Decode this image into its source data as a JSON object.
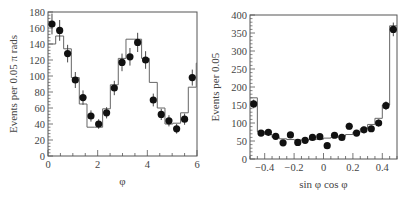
{
  "chart_data": [
    {
      "type": "scatter",
      "title": "",
      "xlabel": "φ",
      "ylabel": "Events per 0.05 π rads",
      "xlim": [
        0,
        6
      ],
      "ylim": [
        0,
        180
      ],
      "xticks": [
        0,
        2,
        4,
        6
      ],
      "yticks": [
        0,
        20,
        40,
        60,
        80,
        100,
        120,
        140,
        160,
        180
      ],
      "grid": false,
      "legend": null,
      "series": [
        {
          "name": "data",
          "style": "points-with-errorbars",
          "x": [
            0.16,
            0.47,
            0.79,
            1.1,
            1.41,
            1.73,
            2.04,
            2.36,
            2.67,
            2.98,
            3.3,
            3.61,
            3.93,
            4.24,
            4.56,
            4.87,
            5.18,
            5.5,
            5.81,
            6.12
          ],
          "x_plotted": [
            0.16,
            0.47,
            0.79,
            1.1,
            1.41,
            1.73,
            2.04,
            2.36,
            2.67,
            2.98,
            3.3,
            3.61,
            3.93,
            4.24,
            4.56,
            4.87,
            5.18,
            5.5,
            5.81
          ],
          "values": [
            165,
            157,
            128,
            95,
            73,
            50,
            40,
            54,
            85,
            117,
            124,
            142,
            120,
            70,
            52,
            44,
            34,
            46,
            98,
            125
          ],
          "errors": [
            13,
            13,
            11,
            10,
            9,
            7,
            6,
            7,
            9,
            11,
            11,
            12,
            11,
            8,
            7,
            7,
            6,
            7,
            10,
            11
          ]
        },
        {
          "name": "fit",
          "style": "step-histogram",
          "bin_edges": [
            0,
            0.31,
            0.63,
            0.94,
            1.26,
            1.57,
            1.88,
            2.2,
            2.51,
            2.83,
            3.14,
            3.46,
            3.77,
            4.08,
            4.4,
            4.71,
            5.03,
            5.34,
            5.65,
            5.97
          ],
          "values": [
            140,
            150,
            134,
            98,
            65,
            36,
            36,
            59,
            89,
            122,
            146,
            146,
            122,
            92,
            60,
            40,
            41,
            54,
            86,
            116
          ]
        }
      ]
    },
    {
      "type": "scatter",
      "title": "",
      "xlabel": "sin φ cos φ",
      "ylabel": "Events per 0.05",
      "xlim": [
        -0.5,
        0.5
      ],
      "ylim": [
        0,
        400
      ],
      "xticks": [
        -0.4,
        -0.2,
        0,
        0.2,
        0.4
      ],
      "yticks": [
        0,
        50,
        100,
        150,
        200,
        250,
        300,
        350,
        400
      ],
      "grid": false,
      "legend": null,
      "series": [
        {
          "name": "data",
          "style": "points-with-errorbars",
          "x": [
            -0.475,
            -0.425,
            -0.375,
            -0.325,
            -0.275,
            -0.225,
            -0.175,
            -0.125,
            -0.075,
            -0.025,
            0.025,
            0.075,
            0.125,
            0.175,
            0.225,
            0.275,
            0.325,
            0.375,
            0.425,
            0.475
          ],
          "values": [
            153,
            72,
            74,
            63,
            45,
            67,
            46,
            52,
            60,
            62,
            37,
            66,
            60,
            91,
            72,
            81,
            84,
            100,
            148,
            360
          ],
          "errors": [
            12,
            8,
            9,
            8,
            7,
            8,
            7,
            7,
            8,
            8,
            6,
            8,
            8,
            10,
            8,
            9,
            9,
            10,
            12,
            19
          ]
        },
        {
          "name": "fit",
          "style": "step-histogram",
          "bin_edges": [
            -0.5,
            -0.45,
            -0.4,
            -0.35,
            -0.3,
            -0.25,
            -0.2,
            -0.15,
            -0.1,
            -0.05,
            0,
            0.05,
            0.1,
            0.15,
            0.2,
            0.25,
            0.3,
            0.35,
            0.4,
            0.45
          ],
          "values": [
            170,
            76,
            68,
            60,
            56,
            54,
            53,
            53,
            54,
            55,
            58,
            60,
            63,
            68,
            74,
            84,
            96,
            113,
            150,
            370
          ]
        }
      ]
    }
  ],
  "charts": {
    "left": {
      "ylabel": "Events per 0.05 π rads",
      "xlabel": "φ"
    },
    "right": {
      "ylabel": "Events per 0.05",
      "xlabel": "sin φ cos φ"
    }
  }
}
